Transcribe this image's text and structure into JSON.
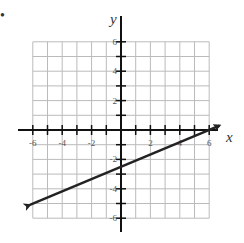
{
  "marker": "•",
  "chart_data": {
    "type": "line",
    "title": "",
    "xlabel": "x",
    "ylabel": "y",
    "xlim": [
      -6,
      6
    ],
    "ylim": [
      -6,
      6
    ],
    "grid": true,
    "x_ticks": [
      -6,
      -4,
      -2,
      2,
      4,
      6
    ],
    "y_ticks": [
      6,
      4,
      2,
      -2,
      -4,
      -6
    ],
    "x_tick_labels": [
      "-6",
      "-4",
      "-2",
      "2",
      "4",
      "6"
    ],
    "y_tick_labels": [
      "6",
      "4",
      "2",
      "-2",
      "-4",
      "-6"
    ],
    "series": [
      {
        "name": "line",
        "y_intercept": -3,
        "slope_estimate": 0.26,
        "slope_note": "measured from arrow endpoints; intended value ambiguous between 1/4 and 1/3",
        "points": [
          [
            -6.2,
            -5.1
          ],
          [
            0,
            -3
          ],
          [
            6.7,
            0.3
          ]
        ],
        "arrows": "both ends",
        "color": "#222222"
      }
    ]
  },
  "style": {
    "grid_color": "#bbbbbb",
    "axis_color": "#111111",
    "line_color": "#222222"
  }
}
